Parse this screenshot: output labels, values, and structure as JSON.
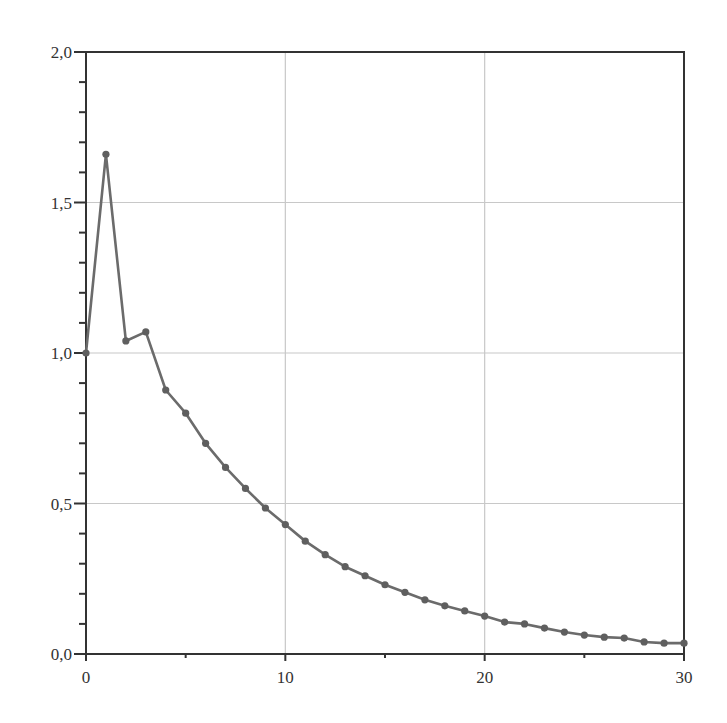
{
  "chart_data": {
    "type": "line",
    "title": "",
    "xlabel": "",
    "ylabel": "",
    "xlim": [
      0,
      30
    ],
    "ylim": [
      0,
      2.0
    ],
    "grid": true,
    "legend": null,
    "x_ticks": [
      0,
      10,
      20,
      30
    ],
    "x_tick_labels": [
      "0",
      "10",
      "20",
      "30"
    ],
    "x_minor_ticks": [
      5,
      15,
      25
    ],
    "y_ticks": [
      0,
      0.5,
      1.0,
      1.5,
      2.0
    ],
    "y_tick_labels": [
      "0,0",
      "0,5",
      "1,0",
      "1,5",
      "2,0"
    ],
    "y_minor_step": 0.1,
    "x": [
      0,
      1,
      2,
      3,
      4,
      5,
      6,
      7,
      8,
      9,
      10,
      11,
      12,
      13,
      14,
      15,
      16,
      17,
      18,
      19,
      20,
      21,
      22,
      23,
      24,
      25,
      26,
      27,
      28,
      29,
      30
    ],
    "series": [
      {
        "name": "series-1",
        "marker": "circle",
        "values": [
          1.0,
          1.66,
          1.04,
          1.07,
          0.877,
          0.8,
          0.7,
          0.62,
          0.55,
          0.485,
          0.43,
          0.375,
          0.33,
          0.29,
          0.26,
          0.23,
          0.205,
          0.18,
          0.16,
          0.143,
          0.126,
          0.106,
          0.1,
          0.086,
          0.073,
          0.063,
          0.056,
          0.053,
          0.04,
          0.036,
          0.036
        ]
      }
    ]
  },
  "colors": {
    "line": "#6b6b6b",
    "marker": "#5f5f5f",
    "axis": "#333333",
    "grid": "#c8c8c8",
    "background": "#ffffff"
  }
}
